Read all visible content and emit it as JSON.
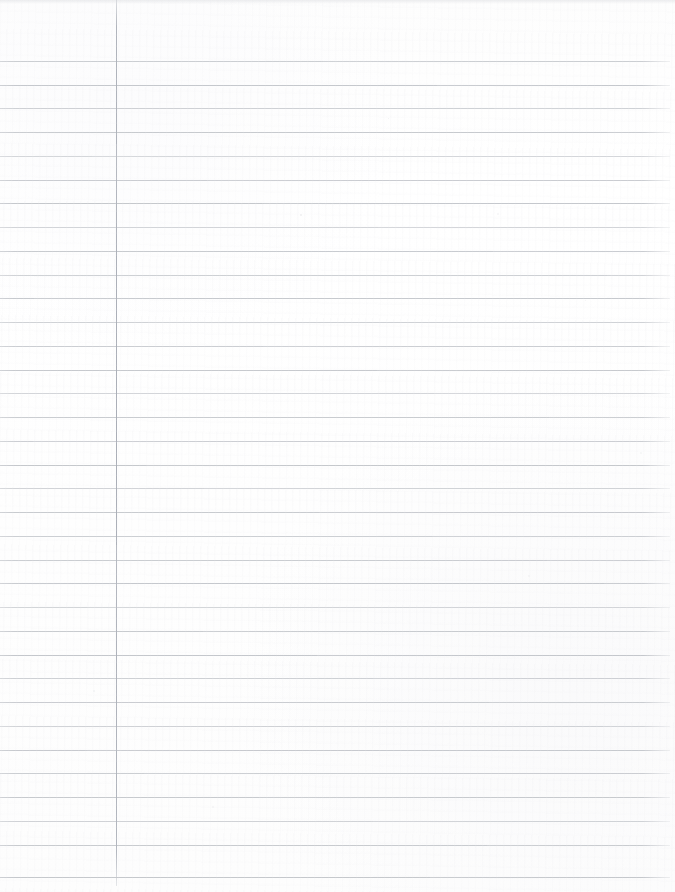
{
  "document": {
    "kind": "scanned-lined-notebook-paper",
    "title": "Blank ruled notebook page",
    "width_px": 675,
    "height_px": 892,
    "orientation": "portrait",
    "content_text": "",
    "is_blank": true
  },
  "paper": {
    "background_color": "#fefefe",
    "tint_color": "#fdfdfd",
    "edge_shadow_color": "#e0e1e4"
  },
  "ruling": {
    "style": "college-ruled",
    "line_color": "#c3c6cb",
    "line_thickness_px": 1,
    "first_line_y": 61,
    "line_spacing_px": 23.7,
    "line_count": 35,
    "line_left_x": 0,
    "line_right_x": 670,
    "top_margin_px": 61,
    "line_y_positions": [
      61,
      85,
      108,
      132,
      156,
      180,
      203,
      227,
      251,
      275,
      298,
      322,
      346,
      370,
      393,
      417,
      441,
      465,
      488,
      512,
      536,
      560,
      583,
      607,
      631,
      655,
      678,
      702,
      726,
      750,
      773,
      797,
      821,
      845,
      877
    ],
    "line_opacities": [
      0.85,
      0.95,
      0.8,
      0.92,
      0.7,
      0.88,
      0.96,
      0.74,
      0.9,
      0.82,
      0.94,
      0.78,
      0.86,
      0.93,
      0.72,
      0.89,
      0.84,
      0.96,
      0.76,
      0.91,
      0.83,
      0.87,
      0.95,
      0.73,
      0.9,
      0.97,
      0.81,
      0.88,
      0.79,
      0.93,
      0.85,
      0.92,
      0.77,
      0.9,
      0.96
    ]
  },
  "margin_rule": {
    "name": "vertical-margin-line",
    "color": "#aeb2bb",
    "x_px": 116,
    "top_y": 0,
    "bottom_y": 886,
    "thickness_px": 1
  },
  "specks": [
    {
      "x": 300,
      "y": 214,
      "size": 2,
      "opacity": 0.45
    },
    {
      "x": 497,
      "y": 213,
      "size": 2,
      "opacity": 0.3
    },
    {
      "x": 528,
      "y": 575,
      "size": 2,
      "opacity": 0.28
    },
    {
      "x": 93,
      "y": 690,
      "size": 2,
      "opacity": 0.35
    },
    {
      "x": 640,
      "y": 452,
      "size": 2,
      "opacity": 0.25
    },
    {
      "x": 212,
      "y": 806,
      "size": 2,
      "opacity": 0.3
    },
    {
      "x": 388,
      "y": 118,
      "size": 1,
      "opacity": 0.4
    },
    {
      "x": 585,
      "y": 300,
      "size": 1,
      "opacity": 0.35
    }
  ]
}
